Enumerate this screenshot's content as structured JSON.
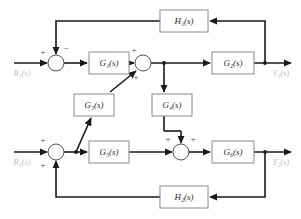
{
  "diagram": {
    "type": "control-system-block-diagram",
    "title": "",
    "canvas": {
      "width": 301,
      "height": 219,
      "background": "#ffffff"
    },
    "colors": {
      "wire": "#1a1a1a",
      "block_border": "#8a8a8a",
      "block_fill": "#ffffff",
      "block_text": "#2b2b2b",
      "io_label": "#c2c2c2",
      "sign_text": "#4a4a4a",
      "junction_border": "#555555"
    },
    "blocks": [
      {
        "id": "H1",
        "base": "H",
        "sub": "1",
        "arg": "(s)",
        "label": "H₁(s)",
        "x": 160,
        "y": 10,
        "w": 48,
        "h": 22
      },
      {
        "id": "G1",
        "base": "G",
        "sub": "1",
        "arg": "(s)",
        "label": "G₁(s)",
        "x": 89,
        "y": 52,
        "w": 40,
        "h": 22
      },
      {
        "id": "G2",
        "base": "G",
        "sub": "2",
        "arg": "(s)",
        "label": "G₂(s)",
        "x": 212,
        "y": 52,
        "w": 42,
        "h": 22
      },
      {
        "id": "G3",
        "base": "G",
        "sub": "3",
        "arg": "(s)",
        "label": "G₃(s)",
        "x": 74,
        "y": 94,
        "w": 40,
        "h": 22
      },
      {
        "id": "G4",
        "base": "G",
        "sub": "4",
        "arg": "(s)",
        "label": "G₄(s)",
        "x": 152,
        "y": 94,
        "w": 40,
        "h": 22
      },
      {
        "id": "G5",
        "base": "G",
        "sub": "5",
        "arg": "(s)",
        "label": "G₅(s)",
        "x": 89,
        "y": 141,
        "w": 40,
        "h": 22
      },
      {
        "id": "G6",
        "base": "G",
        "sub": "6",
        "arg": "(s)",
        "label": "G₆(s)",
        "x": 212,
        "y": 141,
        "w": 42,
        "h": 22
      },
      {
        "id": "H2",
        "base": "H",
        "sub": "2",
        "arg": "(s)",
        "label": "H₂(s)",
        "x": 160,
        "y": 186,
        "w": 48,
        "h": 22
      }
    ],
    "summing_junctions": [
      {
        "id": "S1",
        "cx": 56,
        "cy": 63,
        "r": 8,
        "signs": [
          {
            "text": "+",
            "x": 43,
            "y": 53
          },
          {
            "text": "−",
            "x": 66,
            "y": 49
          }
        ]
      },
      {
        "id": "S2",
        "cx": 143,
        "cy": 63,
        "r": 8,
        "signs": [
          {
            "text": "+",
            "x": 134,
            "y": 51
          },
          {
            "text": "+",
            "x": 136,
            "y": 78
          }
        ]
      },
      {
        "id": "S3",
        "cx": 56,
        "cy": 152,
        "r": 8,
        "signs": [
          {
            "text": "+",
            "x": 43,
            "y": 141
          },
          {
            "text": "+",
            "x": 43,
            "y": 166
          }
        ]
      },
      {
        "id": "S4",
        "cx": 181,
        "cy": 152,
        "r": 8,
        "signs": [
          {
            "text": "+",
            "x": 168,
            "y": 140
          },
          {
            "text": "+",
            "x": 193,
            "y": 140
          }
        ]
      }
    ],
    "io_labels": [
      {
        "id": "R1",
        "base": "R",
        "sub": "1",
        "arg": "(s)",
        "label": "R₁(s)",
        "x": 22,
        "y": 74
      },
      {
        "id": "R2",
        "base": "R",
        "sub": "2",
        "arg": "(s)",
        "label": "R₂(s)",
        "x": 22,
        "y": 163
      },
      {
        "id": "Y1",
        "base": "Y",
        "sub": "1",
        "arg": "(s)",
        "label": "Y₁(s)",
        "x": 281,
        "y": 74
      },
      {
        "id": "Y2",
        "base": "Y",
        "sub": "2",
        "arg": "(s)",
        "label": "Y₂(s)",
        "x": 281,
        "y": 163
      }
    ],
    "nodes": [
      {
        "id": "N1",
        "x": 164,
        "y": 63,
        "desc": "takeoff-after-sum2-to-G4"
      },
      {
        "id": "N2",
        "x": 265,
        "y": 63,
        "desc": "takeoff-Y1-to-H1"
      },
      {
        "id": "N3",
        "x": 76,
        "y": 152,
        "desc": "takeoff-after-sum3-to-G3"
      },
      {
        "id": "N4",
        "x": 265,
        "y": 152,
        "desc": "takeoff-Y2-to-H2"
      }
    ],
    "signals": [
      "R1(s) enters summing junction S1 with + sign",
      "H1(s) feedback enters S1 from above with - sign",
      "S1 output feeds G1(s)",
      "G1(s) output enters S2 with + sign",
      "G3(s) output enters S2 from lower-left with + sign",
      "S2 output branches at node N1 to G2(s) and down to G4(s)",
      "G2(s) output is Y1(s), branches at N2 up into H1(s) feedback",
      "R2(s) enters summing junction S3 with + sign",
      "H2(s) feedback enters S3 from below with + sign",
      "S3 output branches at node N3 to G5(s) and diagonally up to G3(s)",
      "G5(s) output enters S4 with + sign",
      "G4(s) output enters S4 from above with + sign",
      "S4 output feeds G6(s)",
      "G6(s) output is Y2(s), branches at N4 down into H2(s) feedback"
    ]
  }
}
